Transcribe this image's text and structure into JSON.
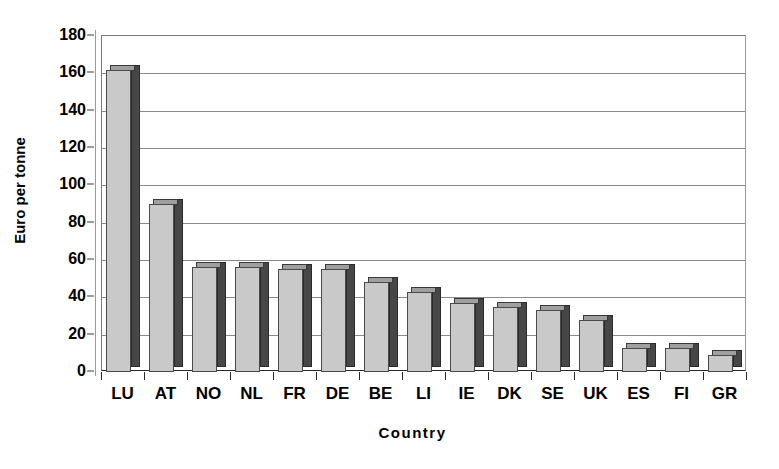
{
  "chart_data": {
    "type": "bar",
    "title": "",
    "subtitle": "",
    "xlabel": "Country",
    "ylabel": "Euro per tonne",
    "categories": [
      "LU",
      "AT",
      "NO",
      "NL",
      "FR",
      "DE",
      "BE",
      "LI",
      "IE",
      "DK",
      "SE",
      "UK",
      "ES",
      "FI",
      "GR"
    ],
    "values": [
      162,
      90,
      56,
      56,
      55,
      55,
      48,
      43,
      37,
      35,
      33,
      28,
      13,
      13,
      9
    ],
    "series": [
      {
        "name": "Euro per tonne",
        "values": [
          162,
          90,
          56,
          56,
          55,
          55,
          48,
          43,
          37,
          35,
          33,
          28,
          13,
          13,
          9
        ]
      }
    ],
    "ylim": [
      0,
      180
    ],
    "ytick_step": 20,
    "yticks": [
      0,
      20,
      40,
      60,
      80,
      100,
      120,
      140,
      160,
      180
    ],
    "ytick_labels": [
      "0",
      "20",
      "40",
      "60",
      "80",
      "100",
      "120",
      "140",
      "160",
      "180"
    ],
    "grid": true,
    "grid_axis": "y",
    "legend": false,
    "legend_position": "none",
    "style": "3d-column",
    "bar_face_color": "#c9c9c9",
    "bar_side_color": "#474747",
    "bar_top_color": "#9f9f9f",
    "bar_edge_color": "#4a4a4a",
    "plot_background": "#ffffff",
    "gridline_color": "#8a8a8a",
    "annotations": []
  }
}
